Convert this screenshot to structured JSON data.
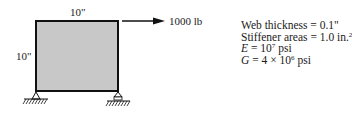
{
  "figure": {
    "panel": {
      "width_label": "10\"",
      "height_label": "10\"",
      "fill_color": "#c8c8c8",
      "edge_color": "#111111"
    },
    "load": {
      "label": "1000 lb",
      "direction": "right",
      "applied_at": "top-right corner"
    },
    "supports": [
      {
        "position": "bottom-left",
        "type": "pin"
      },
      {
        "position": "bottom-right",
        "type": "roller"
      }
    ],
    "properties": {
      "web_thickness": "Web thickness = 0.1\"",
      "stiffener_areas_prefix": "Stiffener areas = 1.0 in.",
      "stiffener_areas_exp": "2",
      "E_symbol": "E",
      "E_text": " = 10",
      "E_exp": "7",
      "E_unit": " psi",
      "G_symbol": "G",
      "G_text": " = 4 × 10",
      "G_exp": "6",
      "G_unit": " psi"
    }
  }
}
